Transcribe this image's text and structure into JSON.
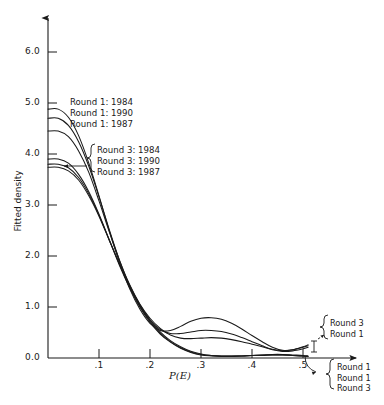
{
  "chart_data": {
    "type": "line",
    "title": "",
    "xlabel": "P(E)",
    "ylabel": "Fitted density",
    "xlim": [
      0.0,
      0.55
    ],
    "ylim": [
      0.0,
      6.5
    ],
    "grid": false,
    "legend_position": "inline-annotations",
    "x_ticks": [
      ".1",
      ".2",
      ".3",
      ".4",
      ".5"
    ],
    "x_tick_values": [
      0.1,
      0.2,
      0.3,
      0.4,
      0.5
    ],
    "y_ticks": [
      "0.0",
      "1.0",
      "2.0",
      "3.0",
      "4.0",
      "5.0",
      "6.0"
    ],
    "y_tick_values": [
      0.0,
      1.0,
      2.0,
      3.0,
      4.0,
      5.0,
      6.0
    ],
    "axis_arrows": [
      "x-right",
      "y-up"
    ],
    "series": [
      {
        "name": "Round 1: 1984",
        "x": [
          0.0,
          0.02,
          0.04,
          0.06,
          0.08,
          0.1,
          0.12,
          0.14,
          0.16,
          0.18,
          0.2,
          0.22,
          0.24,
          0.26,
          0.28,
          0.3,
          0.32,
          0.34,
          0.36,
          0.38,
          0.4,
          0.42,
          0.44,
          0.46,
          0.48,
          0.5,
          0.51
        ],
        "values": [
          4.88,
          4.88,
          4.72,
          4.36,
          3.82,
          3.18,
          2.5,
          1.88,
          1.36,
          0.96,
          0.68,
          0.54,
          0.54,
          0.62,
          0.72,
          0.78,
          0.79,
          0.76,
          0.68,
          0.57,
          0.44,
          0.32,
          0.21,
          0.15,
          0.16,
          0.22,
          0.26
        ]
      },
      {
        "name": "Round 1: 1990",
        "x": [
          0.0,
          0.02,
          0.04,
          0.06,
          0.08,
          0.1,
          0.12,
          0.14,
          0.16,
          0.18,
          0.2,
          0.22,
          0.24,
          0.26,
          0.28,
          0.3,
          0.32,
          0.34,
          0.36,
          0.38,
          0.4,
          0.42,
          0.44,
          0.46,
          0.48,
          0.5,
          0.51
        ],
        "values": [
          4.7,
          4.7,
          4.56,
          4.24,
          3.76,
          3.16,
          2.52,
          1.92,
          1.42,
          1.02,
          0.74,
          0.56,
          0.48,
          0.48,
          0.51,
          0.54,
          0.54,
          0.52,
          0.47,
          0.4,
          0.32,
          0.24,
          0.17,
          0.14,
          0.16,
          0.21,
          0.24
        ]
      },
      {
        "name": "Round 1: 1987",
        "x": [
          0.0,
          0.02,
          0.04,
          0.06,
          0.08,
          0.1,
          0.12,
          0.14,
          0.16,
          0.18,
          0.2,
          0.22,
          0.24,
          0.26,
          0.28,
          0.3,
          0.32,
          0.34,
          0.36,
          0.38,
          0.4,
          0.42,
          0.44,
          0.46,
          0.48,
          0.5,
          0.51
        ],
        "values": [
          4.45,
          4.45,
          4.34,
          4.06,
          3.64,
          3.08,
          2.48,
          1.92,
          1.44,
          1.06,
          0.78,
          0.58,
          0.45,
          0.39,
          0.38,
          0.39,
          0.4,
          0.39,
          0.36,
          0.32,
          0.27,
          0.22,
          0.16,
          0.13,
          0.14,
          0.18,
          0.21
        ]
      },
      {
        "name": "Round 3: 1984",
        "x": [
          0.0,
          0.02,
          0.04,
          0.06,
          0.08,
          0.1,
          0.12,
          0.14,
          0.16,
          0.18,
          0.2,
          0.22,
          0.24,
          0.26,
          0.28,
          0.3,
          0.32,
          0.34,
          0.36,
          0.38,
          0.4,
          0.42,
          0.44,
          0.46,
          0.48,
          0.5,
          0.51
        ],
        "values": [
          3.9,
          3.9,
          3.82,
          3.6,
          3.26,
          2.82,
          2.32,
          1.82,
          1.38,
          1.0,
          0.7,
          0.47,
          0.31,
          0.19,
          0.11,
          0.06,
          0.04,
          0.03,
          0.03,
          0.04,
          0.05,
          0.06,
          0.07,
          0.07,
          0.06,
          0.05,
          0.04
        ]
      },
      {
        "name": "Round 3: 1990",
        "x": [
          0.0,
          0.02,
          0.04,
          0.06,
          0.08,
          0.1,
          0.12,
          0.14,
          0.16,
          0.18,
          0.2,
          0.22,
          0.24,
          0.26,
          0.28,
          0.3,
          0.32,
          0.34,
          0.36,
          0.38,
          0.4,
          0.42,
          0.44,
          0.46,
          0.48,
          0.5,
          0.51
        ],
        "values": [
          3.8,
          3.8,
          3.73,
          3.54,
          3.22,
          2.8,
          2.32,
          1.84,
          1.4,
          1.03,
          0.72,
          0.49,
          0.32,
          0.2,
          0.12,
          0.07,
          0.05,
          0.04,
          0.04,
          0.04,
          0.05,
          0.06,
          0.06,
          0.06,
          0.05,
          0.04,
          0.03
        ]
      },
      {
        "name": "Round 3: 1987",
        "x": [
          0.0,
          0.02,
          0.04,
          0.06,
          0.08,
          0.1,
          0.12,
          0.14,
          0.16,
          0.18,
          0.2,
          0.22,
          0.24,
          0.26,
          0.28,
          0.3,
          0.32,
          0.34,
          0.36,
          0.38,
          0.4,
          0.42,
          0.44,
          0.46,
          0.48,
          0.5,
          0.51
        ],
        "values": [
          3.74,
          3.74,
          3.67,
          3.49,
          3.18,
          2.78,
          2.31,
          1.85,
          1.42,
          1.05,
          0.75,
          0.51,
          0.34,
          0.22,
          0.13,
          0.08,
          0.05,
          0.04,
          0.04,
          0.04,
          0.05,
          0.05,
          0.06,
          0.06,
          0.05,
          0.04,
          0.03
        ]
      }
    ],
    "annotations": [
      {
        "name": "round1-group",
        "lines": [
          "Round 1: 1984",
          "Round 1: 1990",
          "Round 1: 1987"
        ]
      },
      {
        "name": "round3-group",
        "lines": [
          "Round 3: 1984",
          "Round 3: 1990",
          "Round 3: 1987"
        ]
      },
      {
        "name": "right-upper-group",
        "lines": [
          "Round 3",
          "Round 1"
        ]
      },
      {
        "name": "right-lower-group",
        "lines": [
          "Round 1",
          "Round 1",
          "Round 3"
        ]
      }
    ]
  },
  "axes": {
    "ylabel": "Fitted density",
    "xlabel": "P(E)",
    "y_ticks": [
      "6.0",
      "5.0",
      "4.0",
      "3.0",
      "2.0",
      "1.0",
      "0.0"
    ],
    "x_ticks": [
      ".1",
      ".2",
      ".3",
      ".4",
      ".5"
    ]
  },
  "annotations": {
    "round1": [
      "Round 1: 1984",
      "Round 1: 1990",
      "Round 1: 1987"
    ],
    "round3": [
      "Round 3: 1984",
      "Round 3: 1990",
      "Round 3: 1987"
    ],
    "right_upper": [
      "Round 3",
      "Round 1"
    ],
    "right_lower": [
      "Round 1",
      "Round 1",
      "Round 3"
    ]
  },
  "colors": {
    "ink": "#1a1a1a",
    "background": "#ffffff"
  }
}
